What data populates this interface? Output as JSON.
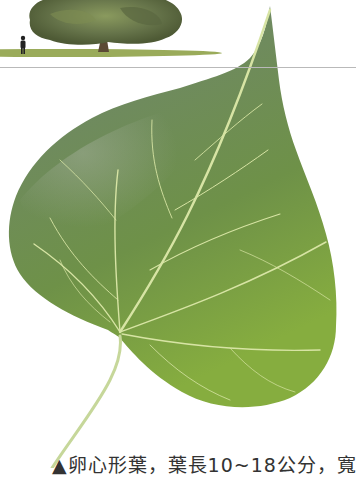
{
  "illustration": {
    "tree_label": "tree-habit-illustration",
    "person_label": "scale-human-figure",
    "leaf_label": "heart-shaped-leaf",
    "colors": {
      "tree_dark": "#4e5a35",
      "tree_light": "#8a9a5e",
      "trunk": "#5b4a34",
      "grass": "#9aab5a",
      "leaf_top": "#6f8a60",
      "leaf_mid": "#6e9148",
      "leaf_bottom": "#7ea53e",
      "vein": "#d7e4a4",
      "petiole": "#c6d79a",
      "divider": "#b9b9b9"
    }
  },
  "caption": {
    "text": "▲卵心形葉，葉長10~18公分，寬"
  }
}
